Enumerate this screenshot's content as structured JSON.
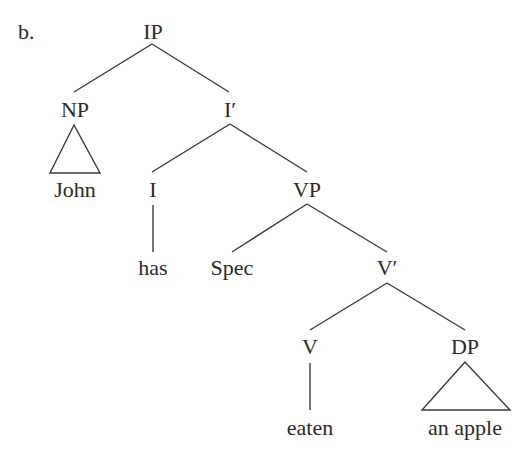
{
  "example_label": "b.",
  "tree": {
    "root": "IP",
    "nodes": {
      "ip": {
        "label": "IP",
        "x": 153,
        "y": 32
      },
      "np": {
        "label": "NP",
        "x": 75,
        "y": 110
      },
      "ibar": {
        "label": "I′",
        "x": 230,
        "y": 110
      },
      "john": {
        "label": "John",
        "x": 75,
        "y": 190
      },
      "i": {
        "label": "I",
        "x": 153,
        "y": 190
      },
      "vp": {
        "label": "VP",
        "x": 307,
        "y": 190
      },
      "has": {
        "label": "has",
        "x": 153,
        "y": 268
      },
      "spec": {
        "label": "Spec",
        "x": 232,
        "y": 268
      },
      "vbar": {
        "label": "V′",
        "x": 387,
        "y": 268
      },
      "v": {
        "label": "V",
        "x": 310,
        "y": 347
      },
      "dp": {
        "label": "DP",
        "x": 465,
        "y": 347
      },
      "eaten": {
        "label": "eaten",
        "x": 310,
        "y": 428
      },
      "an_apple": {
        "label": "an apple",
        "x": 465,
        "y": 428
      }
    },
    "edges": [
      {
        "from": "IP",
        "to": "NP"
      },
      {
        "from": "IP",
        "to": "I′"
      },
      {
        "from": "NP",
        "to": "John",
        "type": "triangle"
      },
      {
        "from": "I′",
        "to": "I"
      },
      {
        "from": "I′",
        "to": "VP"
      },
      {
        "from": "I",
        "to": "has"
      },
      {
        "from": "VP",
        "to": "Spec"
      },
      {
        "from": "VP",
        "to": "V′"
      },
      {
        "from": "V′",
        "to": "V"
      },
      {
        "from": "V′",
        "to": "DP"
      },
      {
        "from": "V",
        "to": "eaten"
      },
      {
        "from": "DP",
        "to": "an apple",
        "type": "triangle"
      }
    ]
  },
  "colors": {
    "text": "#2a2a2a",
    "line": "#3a3a3a",
    "background": "#ffffff"
  }
}
